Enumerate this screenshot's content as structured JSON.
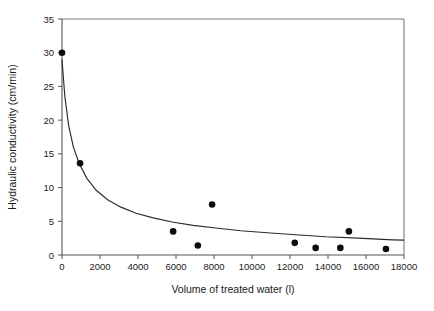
{
  "chart_data": {
    "type": "scatter",
    "title": "",
    "xlabel": "Volume of treated water (l)",
    "ylabel": "Hydraulic conductivity (cm/min)",
    "xlim": [
      0,
      18000
    ],
    "ylim": [
      0,
      35
    ],
    "xticks": [
      0,
      2000,
      4000,
      6000,
      8000,
      10000,
      12000,
      14000,
      16000,
      18000
    ],
    "yticks": [
      0,
      5,
      10,
      15,
      20,
      25,
      30,
      35
    ],
    "xtick_labels": [
      "0",
      "2000",
      "4000",
      "6000",
      "8000",
      "10000",
      "12000",
      "14000",
      "16000",
      "18000"
    ],
    "ytick_labels": [
      "0",
      "5",
      "10",
      "15",
      "20",
      "25",
      "30",
      "35"
    ],
    "grid": false,
    "legend": false,
    "legend_position": "none",
    "series": [
      {
        "name": "Measured hydraulic conductivity",
        "marker": "filled-circle",
        "marker_color": "#0d0d0d",
        "x": [
          0,
          950,
          5850,
          7150,
          7900,
          12250,
          13350,
          14650,
          15100,
          17050
        ],
        "y": [
          30.0,
          13.6,
          3.5,
          1.4,
          7.5,
          1.8,
          1.05,
          1.05,
          3.5,
          0.9
        ]
      },
      {
        "name": "Fitted decay curve",
        "marker": "none",
        "line_color": "#2b2b2b",
        "x": [
          0,
          150,
          350,
          600,
          900,
          1300,
          1800,
          2400,
          3100,
          3900,
          4800,
          5800,
          6900,
          8100,
          9400,
          10800,
          12300,
          13900,
          15600,
          17400,
          18000
        ],
        "y": [
          29.0,
          23.5,
          19.2,
          16.0,
          13.6,
          11.4,
          9.6,
          8.2,
          7.1,
          6.2,
          5.5,
          4.9,
          4.4,
          4.0,
          3.6,
          3.3,
          3.0,
          2.7,
          2.5,
          2.25,
          2.2
        ]
      }
    ]
  },
  "axes": {
    "x_title": "Volume of treated water (l)",
    "y_title": "Hydraulic conductivity (cm/min)"
  },
  "colors": {
    "marker": "#0d0d0d",
    "curve": "#2b2b2b",
    "frame": "#7a7a7a",
    "axis": "#555555",
    "background": "#ffffff"
  }
}
